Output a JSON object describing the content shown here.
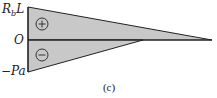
{
  "diagram": {
    "labels": {
      "top": "R",
      "top_sub": "b",
      "top_rest": "L",
      "origin": "O",
      "bottom": "−Pa"
    },
    "caption": "(c)",
    "regions": [
      {
        "sign": "+",
        "icon": "plus-circle-icon",
        "name": "positive-region"
      },
      {
        "sign": "−",
        "icon": "minus-circle-icon",
        "name": "negative-region"
      }
    ],
    "colors": {
      "fill": "#c8c8c8",
      "stroke": "#222222",
      "background": "#ffffff"
    }
  }
}
